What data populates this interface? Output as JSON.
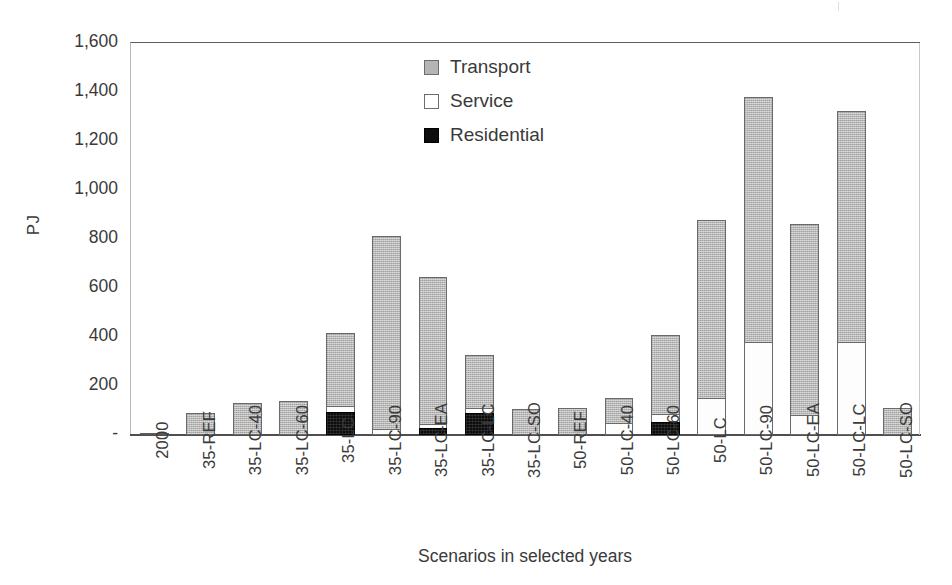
{
  "axes": {
    "y_title": "PJ",
    "x_title": "Scenarios in selected years",
    "y_ticks": [
      "1,600",
      "1,400",
      "1,200",
      "1,000",
      "800",
      "600",
      "400",
      "200",
      "-"
    ]
  },
  "legend": {
    "position": "inside-top-center",
    "items": [
      {
        "label": "Transport",
        "swatch": "transport-swatch-icon",
        "color": "#b5b5b5"
      },
      {
        "label": "Service",
        "swatch": "service-swatch-icon",
        "color": "#ffffff"
      },
      {
        "label": "Residential",
        "swatch": "residential-swatch-icon",
        "color": "#0d0d0d"
      }
    ]
  },
  "chart_data": {
    "type": "bar",
    "subtype": "stacked",
    "title": "",
    "xlabel": "Scenarios in selected years",
    "ylabel": "PJ",
    "ylim": [
      0,
      1600
    ],
    "ytick_step": 200,
    "grid": false,
    "categories": [
      "2000",
      "35-REF",
      "35-LC-40",
      "35-LC-60",
      "35-LC",
      "35-LC-90",
      "35-LC-EA",
      "35-LC-LC",
      "35-LC-SO",
      "50-REF",
      "50-LC-40",
      "50-LC-60",
      "50-LC",
      "50-LC-90",
      "50-LC-EA",
      "50-LC-LC",
      "50-LC-SO"
    ],
    "series": [
      {
        "name": "Residential",
        "color": "#0d0d0d",
        "values": [
          0,
          0,
          0,
          0,
          95,
          0,
          30,
          90,
          0,
          0,
          0,
          55,
          0,
          0,
          0,
          0,
          0
        ]
      },
      {
        "name": "Service",
        "color": "#ffffff",
        "values": [
          0,
          0,
          0,
          0,
          28,
          25,
          20,
          25,
          0,
          0,
          50,
          35,
          150,
          380,
          80,
          380,
          0
        ]
      },
      {
        "name": "Transport",
        "color": "#b5b5b5",
        "values": [
          10,
          90,
          130,
          140,
          302,
          790,
          605,
          220,
          105,
          110,
          105,
          325,
          730,
          1005,
          785,
          945,
          110
        ]
      }
    ],
    "totals": [
      10,
      90,
      130,
      140,
      425,
      815,
      655,
      335,
      105,
      110,
      155,
      415,
      880,
      1385,
      865,
      1325,
      110
    ]
  }
}
